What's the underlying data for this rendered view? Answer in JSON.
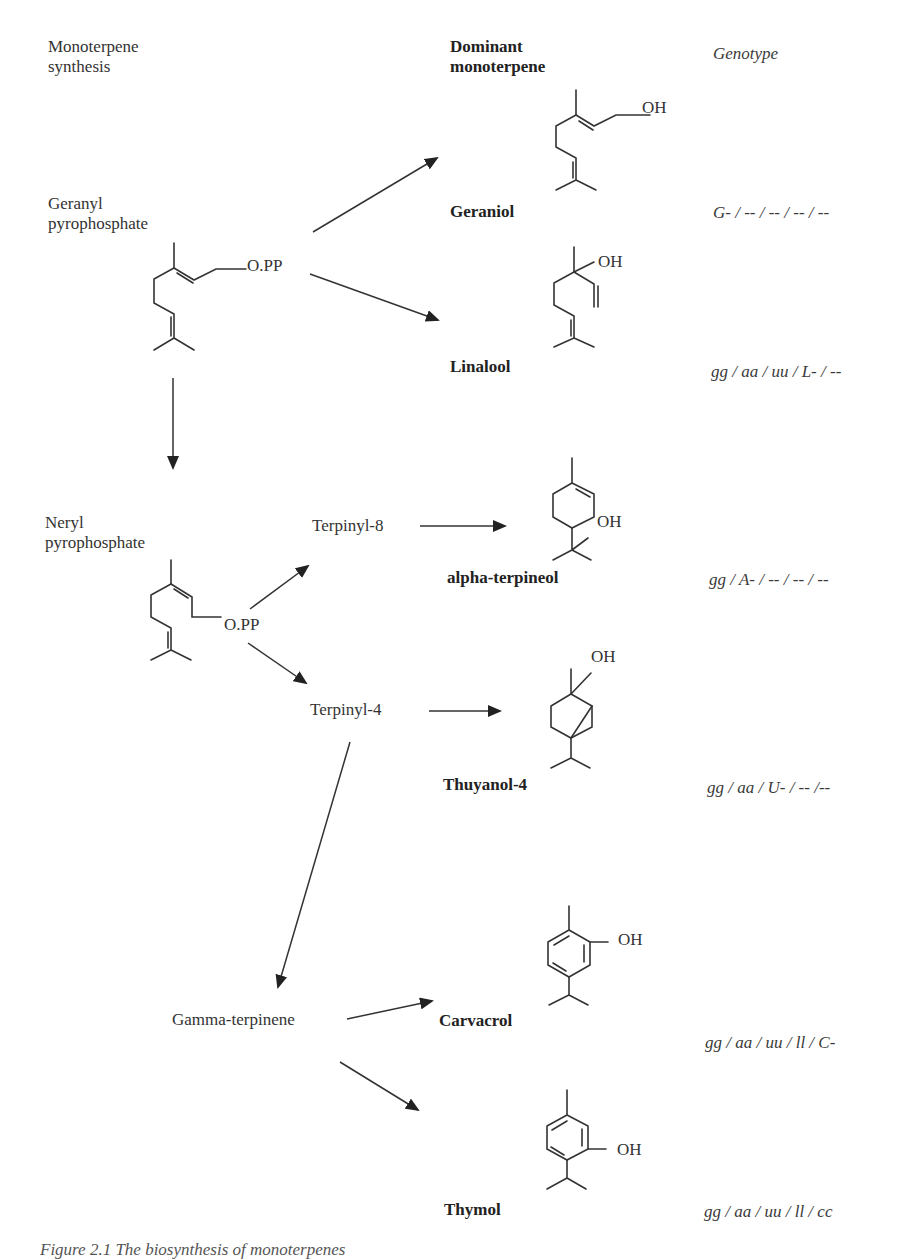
{
  "headers": {
    "pathway": "Monoterpene\nsynthesis",
    "pathway_line1": "Monoterpene",
    "pathway_line2": "synthesis",
    "dominant_line1": "Dominant",
    "dominant_line2": "monoterpene",
    "genotype": "Genotype"
  },
  "precursors": {
    "geranyl_line1": "Geranyl",
    "geranyl_line2": "pyrophosphate",
    "geranyl_group": "O.PP",
    "neryl_line1": "Neryl",
    "neryl_line2": "pyrophosphate",
    "neryl_group": "O.PP"
  },
  "intermediates": {
    "terpinyl8": "Terpinyl-8",
    "terpinyl4": "Terpinyl-4",
    "gamma_terpinene": "Gamma-terpinene"
  },
  "products": [
    {
      "name": "Geraniol",
      "group": "OH",
      "genotype": "G- / -- / -- / -- / --"
    },
    {
      "name": "Linalool",
      "group": "OH",
      "genotype": "gg / aa / uu / L- / --"
    },
    {
      "name": "alpha-terpineol",
      "group": "OH",
      "genotype": "gg / A- / -- / -- / --"
    },
    {
      "name": "Thuyanol-4",
      "group": "OH",
      "genotype": "gg / aa / U- / -- /--"
    },
    {
      "name": "Carvacrol",
      "group": "OH",
      "genotype": "gg / aa / uu / ll / C-"
    },
    {
      "name": "Thymol",
      "group": "OH",
      "genotype": "gg / aa / uu / ll / cc"
    }
  ],
  "caption": "Figure 2.1 The biosynthesis of monoterpenes"
}
